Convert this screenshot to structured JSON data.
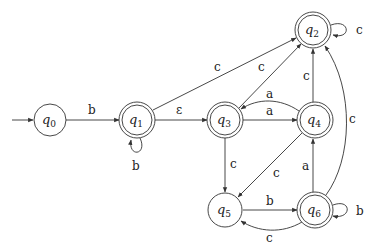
{
  "diagram": {
    "type": "finite-automaton",
    "start_state": "q0",
    "states": [
      {
        "id": "q0",
        "label": "q",
        "sub": "0",
        "x": 50,
        "y": 120,
        "accepting": false
      },
      {
        "id": "q1",
        "label": "q",
        "sub": "1",
        "x": 137,
        "y": 120,
        "accepting": true
      },
      {
        "id": "q2",
        "label": "q",
        "sub": "2",
        "x": 313,
        "y": 30,
        "accepting": true
      },
      {
        "id": "q3",
        "label": "q",
        "sub": "3",
        "x": 225,
        "y": 120,
        "accepting": true
      },
      {
        "id": "q4",
        "label": "q",
        "sub": "4",
        "x": 315,
        "y": 120,
        "accepting": true
      },
      {
        "id": "q5",
        "label": "q",
        "sub": "5",
        "x": 225,
        "y": 210,
        "accepting": false
      },
      {
        "id": "q6",
        "label": "q",
        "sub": "6",
        "x": 315,
        "y": 210,
        "accepting": true
      }
    ],
    "transitions": [
      {
        "from": "q0",
        "to": "q1",
        "symbol": "b"
      },
      {
        "from": "q1",
        "to": "q1",
        "symbol": "b"
      },
      {
        "from": "q1",
        "to": "q3",
        "symbol": "ε"
      },
      {
        "from": "q1",
        "to": "q2",
        "symbol": "c"
      },
      {
        "from": "q2",
        "to": "q2",
        "symbol": "c"
      },
      {
        "from": "q3",
        "to": "q2",
        "symbol": "c"
      },
      {
        "from": "q3",
        "to": "q4",
        "symbol": "a"
      },
      {
        "from": "q4",
        "to": "q3",
        "symbol": "a"
      },
      {
        "from": "q3",
        "to": "q5",
        "symbol": "c"
      },
      {
        "from": "q4",
        "to": "q2",
        "symbol": "c"
      },
      {
        "from": "q4",
        "to": "q5",
        "symbol": "c"
      },
      {
        "from": "q5",
        "to": "q6",
        "symbol": "b"
      },
      {
        "from": "q6",
        "to": "q5",
        "symbol": "c"
      },
      {
        "from": "q6",
        "to": "q4",
        "symbol": "a"
      },
      {
        "from": "q6",
        "to": "q6",
        "symbol": "b"
      },
      {
        "from": "q6",
        "to": "q2",
        "symbol": "c"
      }
    ]
  }
}
